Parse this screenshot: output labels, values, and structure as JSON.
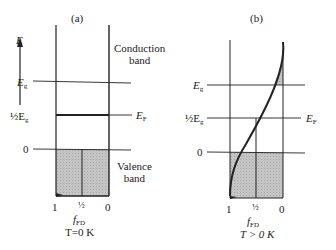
{
  "panels": {
    "a": {
      "title": "(a)",
      "axis_label": "E",
      "levels": {
        "eg": "E",
        "eg_sub": "g",
        "half": "½E",
        "half_sub": "g",
        "zero": "0"
      },
      "ef": "E",
      "ef_sub": "F",
      "conduction": [
        "Conduction",
        "band"
      ],
      "valence": [
        "Valence",
        "band"
      ],
      "ticks": [
        "1",
        "½",
        "0"
      ],
      "xlabel": "f",
      "xlabel_sub": "FD",
      "condition": "T=0 K"
    },
    "b": {
      "title": "(b)",
      "levels": {
        "eg": "E",
        "eg_sub": "g",
        "half": "½E",
        "half_sub": "g",
        "zero": "0"
      },
      "ef": "E",
      "ef_sub": "F",
      "ticks": [
        "1",
        "½",
        "0"
      ],
      "xlabel": "f",
      "xlabel_sub": "FD",
      "condition": "T > 0 K"
    }
  },
  "colors": {
    "line": "#222222",
    "fill": "#bdbdbd"
  }
}
